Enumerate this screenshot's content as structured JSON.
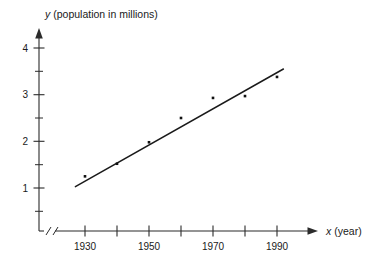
{
  "chart_data": {
    "type": "scatter",
    "title": "",
    "xlabel": "x (year)",
    "ylabel": "y (population in millions)",
    "xlabel_var": "x",
    "xlabel_unit": "(year)",
    "ylabel_var": "y",
    "ylabel_unit": "(population in millions)",
    "x": [
      1930,
      1940,
      1950,
      1960,
      1970,
      1980,
      1990
    ],
    "values": [
      1.25,
      1.52,
      1.98,
      2.5,
      2.93,
      2.97,
      3.38
    ],
    "points": [
      {
        "x": 1930,
        "y": 1.25
      },
      {
        "x": 1940,
        "y": 1.52
      },
      {
        "x": 1950,
        "y": 1.98
      },
      {
        "x": 1960,
        "y": 2.5
      },
      {
        "x": 1970,
        "y": 2.93
      },
      {
        "x": 1980,
        "y": 2.97
      },
      {
        "x": 1990,
        "y": 3.38
      }
    ],
    "trendline": {
      "type": "line-of-best-fit",
      "x_start": 1927,
      "y_start": 1.03,
      "x_end": 1992,
      "y_end": 3.55
    },
    "xlim": [
      1924,
      1994
    ],
    "ylim": [
      0,
      4.3
    ],
    "xticks": [
      1930,
      1940,
      1950,
      1960,
      1970,
      1980,
      1990
    ],
    "xtick_labels": [
      "1930",
      "",
      "1950",
      "",
      "1970",
      "",
      "1990"
    ],
    "xticks_labeled": [
      1930,
      1950,
      1970,
      1990
    ],
    "yticks": [
      0.5,
      1,
      1.5,
      2,
      2.5,
      3,
      3.5,
      4
    ],
    "ytick_labels": [
      "",
      "1",
      "",
      "2",
      "",
      "3",
      "",
      "4"
    ],
    "yticks_labeled": [
      1,
      2,
      3,
      4
    ],
    "grid": false,
    "legend": null,
    "axis_break_x": true,
    "axis_break_y": true,
    "colors": {
      "axis": "#2b2b2b",
      "point": "#111111",
      "line": "#1a1a1a",
      "background": "#ffffff"
    }
  },
  "labels": {
    "y1": "1",
    "y2": "2",
    "y3": "3",
    "y4": "4",
    "x1930": "1930",
    "x1950": "1950",
    "x1970": "1970",
    "x1990": "1990"
  }
}
